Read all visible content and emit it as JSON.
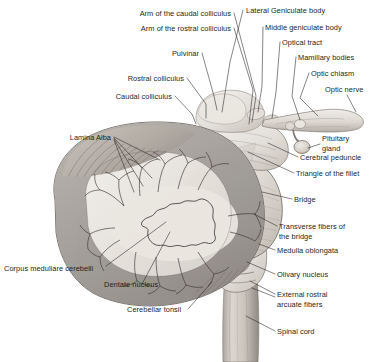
{
  "figure": {
    "background_color": "#ffffff",
    "label_color": "#231f20",
    "leader_color": "#231f20"
  },
  "labels": [
    {
      "id": "arm-caudal-colliculus",
      "text": "Arm of the caudal colliculus",
      "anchor": "end",
      "x": 231,
      "y": 16
    },
    {
      "id": "lateral-geniculate",
      "text": "Lateral Geniculate body",
      "anchor": "start",
      "x": 246,
      "y": 13
    },
    {
      "id": "arm-rostral-colliculus",
      "text": "Arm of the rostral colliculus",
      "anchor": "end",
      "x": 231,
      "y": 31
    },
    {
      "id": "middle-geniculate",
      "text": "Middle geniculate body",
      "anchor": "start",
      "x": 265,
      "y": 30
    },
    {
      "id": "optical-tract",
      "text": "Optical tract",
      "anchor": "start",
      "x": 282,
      "y": 45
    },
    {
      "id": "pulvinar",
      "text": "Pulvinar",
      "anchor": "end",
      "x": 199,
      "y": 56
    },
    {
      "id": "mamillary-bodies",
      "text": "Mamillary bodies",
      "anchor": "start",
      "x": 298,
      "y": 60
    },
    {
      "id": "optic-chiasm",
      "text": "Optic chiasm",
      "anchor": "start",
      "x": 311,
      "y": 76
    },
    {
      "id": "rostral-colliculus",
      "text": "Rostral colliculus",
      "anchor": "end",
      "x": 184,
      "y": 81
    },
    {
      "id": "optic-nerve",
      "text": "Optic nerve",
      "anchor": "start",
      "x": 325,
      "y": 92
    },
    {
      "id": "caudal-colliculus",
      "text": "Caudal colliculus",
      "anchor": "end",
      "x": 172,
      "y": 99
    },
    {
      "id": "lamina-alba",
      "text": "Lamina Alba",
      "anchor": "end",
      "x": 111,
      "y": 140
    },
    {
      "id": "cerebral-peduncle",
      "text": "Cerebral peduncle",
      "anchor": "start",
      "x": 300,
      "y": 160
    },
    {
      "id": "triangle-fillet",
      "text": "Triangle of the fillet",
      "anchor": "start",
      "x": 296,
      "y": 176
    },
    {
      "id": "bridge",
      "text": "Bridge",
      "anchor": "start",
      "x": 294,
      "y": 202
    },
    {
      "id": "transverse-fibers",
      "text": "Transverse fibers of",
      "anchor": "start",
      "x": 279,
      "y": 229
    },
    {
      "id": "transverse-fibers-2",
      "text": "the bridge",
      "anchor": "start",
      "x": 279,
      "y": 239
    },
    {
      "id": "medulla-oblongata",
      "text": "Medulla oblongata",
      "anchor": "start",
      "x": 277,
      "y": 253
    },
    {
      "id": "corpus-medullare",
      "text": "Corpus medullare cerebelli",
      "anchor": "start",
      "x": 4,
      "y": 271
    },
    {
      "id": "olivary-nucleus",
      "text": "Olivary nucleus",
      "anchor": "start",
      "x": 277,
      "y": 277
    },
    {
      "id": "dentate-nucleus",
      "text": "Dentate nucleus",
      "anchor": "start",
      "x": 104,
      "y": 287
    },
    {
      "id": "external-rostral",
      "text": "External rostral",
      "anchor": "start",
      "x": 277,
      "y": 297
    },
    {
      "id": "external-rostral-2",
      "text": "arcuate fibers",
      "anchor": "start",
      "x": 277,
      "y": 307
    },
    {
      "id": "cerebellar-tonsil",
      "text": "Cerebellar tonsil",
      "anchor": "start",
      "x": 127,
      "y": 312
    },
    {
      "id": "spinal-cord",
      "text": "Spinal cord",
      "anchor": "start",
      "x": 277,
      "y": 334
    },
    {
      "id": "pituitary-gland",
      "text": "Pituitary",
      "anchor": "start",
      "x": 322,
      "y": 141
    },
    {
      "id": "pituitary-gland-2",
      "text": "gland",
      "anchor": "start",
      "x": 322,
      "y": 151
    }
  ],
  "structures": [
    {
      "id": "cerebellum",
      "name": "cerebellum-cross-section"
    },
    {
      "id": "arbor-vitae",
      "name": "arbor-vitae-white-matter"
    },
    {
      "id": "dentate-nucleus",
      "name": "dentate-nucleus-outline"
    },
    {
      "id": "pons",
      "name": "pons-bridge"
    },
    {
      "id": "medulla",
      "name": "medulla-oblongata-body"
    },
    {
      "id": "olive",
      "name": "olivary-nucleus-body"
    },
    {
      "id": "spinal-cord",
      "name": "spinal-cord-body"
    },
    {
      "id": "midbrain",
      "name": "midbrain-colliculi"
    },
    {
      "id": "optic-nerve",
      "name": "optic-nerve-body"
    },
    {
      "id": "pituitary",
      "name": "pituitary-gland-body"
    },
    {
      "id": "peduncle",
      "name": "cerebral-peduncle-body"
    }
  ]
}
